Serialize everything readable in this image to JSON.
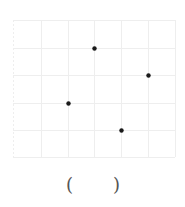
{
  "diagram": {
    "type": "dot-grid",
    "grid": {
      "cols": 6,
      "rows": 5,
      "x_lines": [
        13,
        41,
        68,
        94,
        121,
        148,
        175
      ],
      "y_lines": [
        20,
        48,
        75,
        103,
        130,
        157
      ],
      "line_color": "#eeeeee"
    },
    "points": [
      {
        "col": 3,
        "row": 1
      },
      {
        "col": 5,
        "row": 2
      },
      {
        "col": 2,
        "row": 3
      },
      {
        "col": 4,
        "row": 4
      }
    ],
    "point_color": "#1a1a1a",
    "point_radius": 2.2
  },
  "answer": {
    "open_paren": "(",
    "close_paren": ")"
  }
}
